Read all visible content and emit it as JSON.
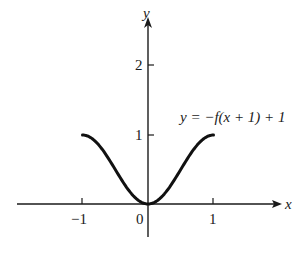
{
  "chart_data": {
    "type": "line",
    "title": "",
    "xlabel": "x",
    "ylabel": "y",
    "xlim": [
      -2,
      2
    ],
    "ylim": [
      -0.5,
      2.6
    ],
    "x_ticks": [
      -1,
      0,
      1
    ],
    "x_tick_labels": [
      "−1",
      "0",
      "1"
    ],
    "y_ticks": [
      1,
      2
    ],
    "y_tick_labels": [
      "1",
      "2"
    ],
    "grid": false,
    "legend": null,
    "annotations": [
      {
        "text": "y = −f(x + 1) + 1",
        "x": 0.6,
        "y": 1.4
      }
    ],
    "series": [
      {
        "name": "y = −f(x + 1) + 1",
        "x": [
          -1,
          -0.75,
          -0.5,
          -0.25,
          0,
          0.25,
          0.5,
          0.75,
          1
        ],
        "y": [
          1,
          0.85,
          0.5,
          0.15,
          0,
          0.15,
          0.5,
          0.85,
          1
        ]
      }
    ]
  },
  "labels": {
    "x_axis": "x",
    "y_axis": "y",
    "tick_x_neg1": "−1",
    "tick_x_0": "0",
    "tick_x_1": "1",
    "tick_y_1": "1",
    "tick_y_2": "2",
    "equation": "y = −f(x + 1) + 1"
  },
  "colors": {
    "ink": "#1a1a1a",
    "background": "#ffffff"
  }
}
